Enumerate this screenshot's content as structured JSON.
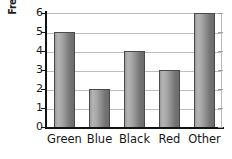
{
  "chart_data": {
    "type": "bar",
    "title": "",
    "xlabel": "",
    "ylabel": "Frequency",
    "categories": [
      "Green",
      "Blue",
      "Black",
      "Red",
      "Other"
    ],
    "values": [
      5,
      2,
      4,
      3,
      6
    ],
    "series": [
      {
        "name": "Frequency",
        "values": [
          5,
          2,
          4,
          3,
          6
        ]
      }
    ],
    "ylim": [
      0,
      6
    ],
    "ytick_labels": [
      "0",
      "1",
      "2",
      "3",
      "4",
      "5",
      "6"
    ],
    "ytick_values": [
      0,
      1,
      2,
      3,
      4,
      5,
      6
    ],
    "grid": true,
    "grid_axis": "y",
    "legend": false,
    "legend_position": "none",
    "bar_fill": "#a0a0a0",
    "bar_outline": "#4a4a4a",
    "axis_color": "#121212",
    "grid_color": "#bdbdbd",
    "background": "#ffffff"
  }
}
